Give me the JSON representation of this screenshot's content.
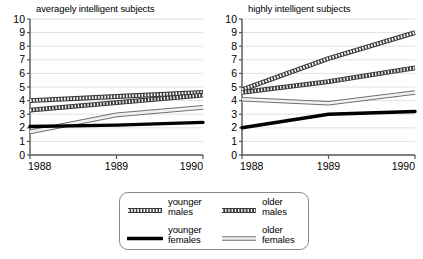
{
  "charts": [
    {
      "title": "averagely intelligent subjects",
      "xlabel": "",
      "ylabel": "",
      "xticks": [
        "1988",
        "1989",
        "1990"
      ],
      "yticks": [
        "0",
        "1",
        "2",
        "3",
        "4",
        "5",
        "6",
        "7",
        "8",
        "9",
        "10"
      ]
    },
    {
      "title": "highly intelligent subjects",
      "xlabel": "",
      "ylabel": "",
      "xticks": [
        "1988",
        "1989",
        "1990"
      ],
      "yticks": [
        "0",
        "1",
        "2",
        "3",
        "4",
        "5",
        "6",
        "7",
        "8",
        "9",
        "10"
      ]
    }
  ],
  "legend": {
    "items": [
      {
        "label": "younger\nmales",
        "style": "hatched",
        "swatch_name": "legend-swatch-younger-males"
      },
      {
        "label": "older\nmales",
        "style": "dotted",
        "swatch_name": "legend-swatch-older-males"
      },
      {
        "label": "younger\nfemales",
        "style": "solid",
        "swatch_name": "legend-swatch-younger-females"
      },
      {
        "label": "older\nfemales",
        "style": "outlined",
        "swatch_name": "legend-swatch-older-females"
      }
    ]
  },
  "chart_data": [
    {
      "type": "line",
      "title": "averagely intelligent subjects",
      "xlabel": "",
      "ylabel": "",
      "x": [
        1988,
        1989,
        1990
      ],
      "xtick_labels": [
        "1988",
        "1989",
        "1990"
      ],
      "xlim": [
        1988,
        1990
      ],
      "ylim": [
        0,
        10
      ],
      "ytick_labels": [
        "0",
        "1",
        "2",
        "3",
        "4",
        "5",
        "6",
        "7",
        "8",
        "9",
        "10"
      ],
      "grid": true,
      "legend_position": "below-figure",
      "series": [
        {
          "name": "younger males",
          "style": "hatched",
          "values": [
            4.0,
            4.3,
            4.6
          ]
        },
        {
          "name": "older males",
          "style": "dotted",
          "values": [
            3.3,
            3.85,
            4.4
          ]
        },
        {
          "name": "younger females",
          "style": "solid",
          "values": [
            2.1,
            2.2,
            2.4
          ]
        },
        {
          "name": "older females",
          "style": "outlined",
          "values": [
            1.7,
            2.95,
            3.5
          ]
        }
      ]
    },
    {
      "type": "line",
      "title": "highly intelligent subjects",
      "xlabel": "",
      "ylabel": "",
      "x": [
        1988,
        1989,
        1990
      ],
      "xtick_labels": [
        "1988",
        "1989",
        "1990"
      ],
      "xlim": [
        1988,
        1990
      ],
      "ylim": [
        0,
        10
      ],
      "ytick_labels": [
        "0",
        "1",
        "2",
        "3",
        "4",
        "5",
        "6",
        "7",
        "8",
        "9",
        "10"
      ],
      "grid": true,
      "legend_position": "below-figure",
      "series": [
        {
          "name": "younger males",
          "style": "hatched",
          "values": [
            4.8,
            7.1,
            9.0
          ]
        },
        {
          "name": "older males",
          "style": "dotted",
          "values": [
            4.6,
            5.4,
            6.4
          ]
        },
        {
          "name": "younger females",
          "style": "solid",
          "values": [
            2.0,
            3.0,
            3.2
          ]
        },
        {
          "name": "older females",
          "style": "outlined",
          "values": [
            4.1,
            3.8,
            4.6
          ]
        }
      ]
    }
  ]
}
